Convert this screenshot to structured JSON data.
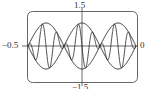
{
  "chart_data": {
    "type": "line",
    "title": "",
    "xlabel": "",
    "ylabel": "",
    "xlim": [
      -0.5,
      0
    ],
    "ylim": [
      -1.5,
      1.5
    ],
    "tick_labels": {
      "top": "1.5",
      "bottom": "-1.5",
      "left": "-0.5",
      "right": "0"
    },
    "grid": false,
    "legend": null,
    "series": [
      {
        "name": "envelope_upper",
        "expr": "abs(sin(6*pi*x))",
        "style": "smooth"
      },
      {
        "name": "envelope_lower",
        "expr": "-abs(sin(6*pi*x))",
        "style": "smooth"
      },
      {
        "name": "modulated_wave",
        "expr": "sin(6*pi*x)*sin(60*pi*x)",
        "style": "line"
      }
    ],
    "envelope_lobes": 3,
    "envelope_amplitude": 1.0
  },
  "labels": {
    "top": "1.5",
    "bottom": "−1.5",
    "left": "−0.5",
    "right": "0"
  },
  "colors": {
    "line": "#222222",
    "frame": "#555555",
    "axis": "#444444"
  }
}
